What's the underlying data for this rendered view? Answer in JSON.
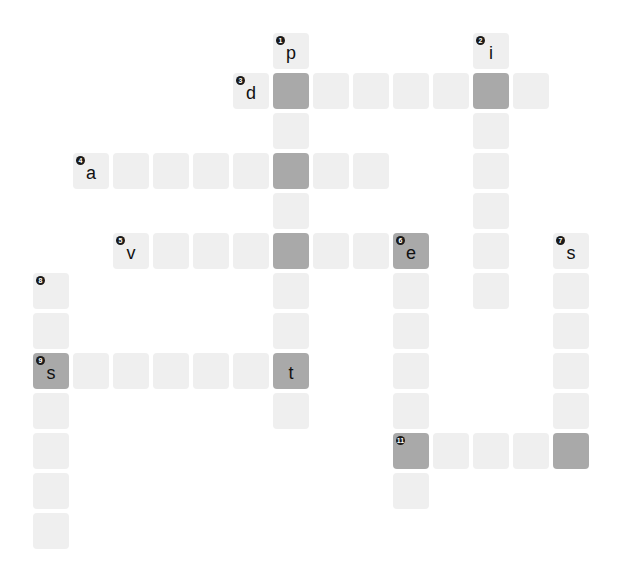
{
  "puzzle": {
    "title_fragment": "",
    "colors": {
      "cell_light": "#efefef",
      "cell_dark": "#a9a9a9",
      "text": "#111111",
      "number_badge": "#1a1a1a"
    },
    "grid": {
      "origin_x": 33,
      "origin_y": 33,
      "pitch": 40,
      "cell_size": 36
    },
    "cells": [
      {
        "r": 0,
        "c": 6,
        "num": "1",
        "letter": "p",
        "dark": false
      },
      {
        "r": 1,
        "c": 6,
        "num": "",
        "letter": "",
        "dark": true
      },
      {
        "r": 2,
        "c": 6,
        "num": "",
        "letter": "",
        "dark": false
      },
      {
        "r": 3,
        "c": 6,
        "num": "",
        "letter": "",
        "dark": true
      },
      {
        "r": 4,
        "c": 6,
        "num": "",
        "letter": "",
        "dark": false
      },
      {
        "r": 5,
        "c": 6,
        "num": "",
        "letter": "",
        "dark": true
      },
      {
        "r": 6,
        "c": 6,
        "num": "",
        "letter": "",
        "dark": false
      },
      {
        "r": 7,
        "c": 6,
        "num": "",
        "letter": "",
        "dark": false
      },
      {
        "r": 8,
        "c": 6,
        "num": "",
        "letter": "t",
        "dark": true
      },
      {
        "r": 9,
        "c": 6,
        "num": "",
        "letter": "",
        "dark": false
      },
      {
        "r": 0,
        "c": 11,
        "num": "2",
        "letter": "i",
        "dark": false
      },
      {
        "r": 1,
        "c": 11,
        "num": "",
        "letter": "",
        "dark": true
      },
      {
        "r": 2,
        "c": 11,
        "num": "",
        "letter": "",
        "dark": false
      },
      {
        "r": 3,
        "c": 11,
        "num": "",
        "letter": "",
        "dark": false
      },
      {
        "r": 4,
        "c": 11,
        "num": "",
        "letter": "",
        "dark": false
      },
      {
        "r": 5,
        "c": 11,
        "num": "",
        "letter": "",
        "dark": false
      },
      {
        "r": 6,
        "c": 11,
        "num": "",
        "letter": "",
        "dark": false
      },
      {
        "r": 1,
        "c": 5,
        "num": "3",
        "letter": "d",
        "dark": false
      },
      {
        "r": 1,
        "c": 7,
        "num": "",
        "letter": "",
        "dark": false
      },
      {
        "r": 1,
        "c": 8,
        "num": "",
        "letter": "",
        "dark": false
      },
      {
        "r": 1,
        "c": 9,
        "num": "",
        "letter": "",
        "dark": false
      },
      {
        "r": 1,
        "c": 10,
        "num": "",
        "letter": "",
        "dark": false
      },
      {
        "r": 1,
        "c": 12,
        "num": "",
        "letter": "",
        "dark": false
      },
      {
        "r": 3,
        "c": 1,
        "num": "4",
        "letter": "a",
        "dark": false
      },
      {
        "r": 3,
        "c": 2,
        "num": "",
        "letter": "",
        "dark": false
      },
      {
        "r": 3,
        "c": 3,
        "num": "",
        "letter": "",
        "dark": false
      },
      {
        "r": 3,
        "c": 4,
        "num": "",
        "letter": "",
        "dark": false
      },
      {
        "r": 3,
        "c": 5,
        "num": "",
        "letter": "",
        "dark": false
      },
      {
        "r": 3,
        "c": 7,
        "num": "",
        "letter": "",
        "dark": false
      },
      {
        "r": 3,
        "c": 8,
        "num": "",
        "letter": "",
        "dark": false
      },
      {
        "r": 5,
        "c": 2,
        "num": "5",
        "letter": "v",
        "dark": false
      },
      {
        "r": 5,
        "c": 3,
        "num": "",
        "letter": "",
        "dark": false
      },
      {
        "r": 5,
        "c": 4,
        "num": "",
        "letter": "",
        "dark": false
      },
      {
        "r": 5,
        "c": 5,
        "num": "",
        "letter": "",
        "dark": false
      },
      {
        "r": 5,
        "c": 7,
        "num": "",
        "letter": "",
        "dark": false
      },
      {
        "r": 5,
        "c": 8,
        "num": "",
        "letter": "",
        "dark": false
      },
      {
        "r": 5,
        "c": 9,
        "num": "6",
        "letter": "e",
        "dark": true
      },
      {
        "r": 6,
        "c": 9,
        "num": "",
        "letter": "",
        "dark": false
      },
      {
        "r": 7,
        "c": 9,
        "num": "",
        "letter": "",
        "dark": false
      },
      {
        "r": 8,
        "c": 9,
        "num": "",
        "letter": "",
        "dark": false
      },
      {
        "r": 9,
        "c": 9,
        "num": "",
        "letter": "",
        "dark": false
      },
      {
        "r": 10,
        "c": 9,
        "num": "11",
        "letter": "",
        "dark": true
      },
      {
        "r": 11,
        "c": 9,
        "num": "",
        "letter": "",
        "dark": false
      },
      {
        "r": 5,
        "c": 13,
        "num": "7",
        "letter": "s",
        "dark": false
      },
      {
        "r": 6,
        "c": 13,
        "num": "",
        "letter": "",
        "dark": false
      },
      {
        "r": 7,
        "c": 13,
        "num": "",
        "letter": "",
        "dark": false
      },
      {
        "r": 8,
        "c": 13,
        "num": "",
        "letter": "",
        "dark": false
      },
      {
        "r": 9,
        "c": 13,
        "num": "",
        "letter": "",
        "dark": false
      },
      {
        "r": 10,
        "c": 13,
        "num": "",
        "letter": "",
        "dark": true
      },
      {
        "r": 10,
        "c": 10,
        "num": "",
        "letter": "",
        "dark": false
      },
      {
        "r": 10,
        "c": 11,
        "num": "",
        "letter": "",
        "dark": false
      },
      {
        "r": 10,
        "c": 12,
        "num": "",
        "letter": "",
        "dark": false
      },
      {
        "r": 6,
        "c": 0,
        "num": "8",
        "letter": "",
        "dark": false
      },
      {
        "r": 7,
        "c": 0,
        "num": "",
        "letter": "",
        "dark": false
      },
      {
        "r": 8,
        "c": 0,
        "num": "9",
        "letter": "s",
        "dark": true
      },
      {
        "r": 9,
        "c": 0,
        "num": "",
        "letter": "",
        "dark": false
      },
      {
        "r": 10,
        "c": 0,
        "num": "",
        "letter": "",
        "dark": false
      },
      {
        "r": 11,
        "c": 0,
        "num": "",
        "letter": "",
        "dark": false
      },
      {
        "r": 12,
        "c": 0,
        "num": "",
        "letter": "",
        "dark": false
      },
      {
        "r": 8,
        "c": 1,
        "num": "",
        "letter": "",
        "dark": false
      },
      {
        "r": 8,
        "c": 2,
        "num": "",
        "letter": "",
        "dark": false
      },
      {
        "r": 8,
        "c": 3,
        "num": "",
        "letter": "",
        "dark": false
      },
      {
        "r": 8,
        "c": 4,
        "num": "",
        "letter": "",
        "dark": false
      },
      {
        "r": 8,
        "c": 5,
        "num": "",
        "letter": "",
        "dark": false
      }
    ]
  }
}
